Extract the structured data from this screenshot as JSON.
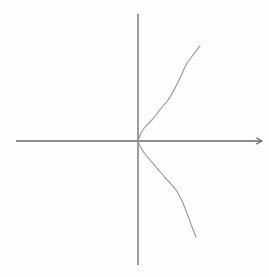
{
  "figure": {
    "title": "",
    "background_color": "#fefefe",
    "width": 269,
    "height": 277
  },
  "chart_data": {
    "type": "line",
    "title": "",
    "xlabel": "",
    "ylabel": "",
    "grid": false,
    "legend": null,
    "equation": "x = a*y^2",
    "origin_px": [
      138,
      141
    ],
    "xlim": [
      -122,
      124
    ],
    "ylim": [
      -124,
      127
    ],
    "axes": {
      "x_axis": {
        "name": "x-axis",
        "y_px": 141,
        "x_start_px": 16,
        "x_end_px": 262,
        "arrow": "right",
        "color": "#666666",
        "tick_labels": []
      },
      "y_axis": {
        "name": "y-axis",
        "x_px": 138,
        "y_start_px": 14,
        "y_end_px": 265,
        "arrow": "none",
        "color": "#666666",
        "tick_labels": []
      }
    },
    "series": [
      {
        "name": "parabola-upper-branch",
        "color": "#9a9a9a",
        "points_px": [
          [
            138,
            141
          ],
          [
            141,
            133
          ],
          [
            145,
            127
          ],
          [
            150,
            122
          ],
          [
            156,
            115
          ],
          [
            163,
            106
          ],
          [
            168,
            100
          ],
          [
            174,
            90
          ],
          [
            180,
            78
          ],
          [
            186,
            65
          ],
          [
            193,
            55
          ],
          [
            200,
            46
          ]
        ]
      },
      {
        "name": "parabola-lower-branch",
        "color": "#9a9a9a",
        "points_px": [
          [
            138,
            141
          ],
          [
            141,
            148
          ],
          [
            145,
            154
          ],
          [
            150,
            160
          ],
          [
            156,
            167
          ],
          [
            162,
            174
          ],
          [
            169,
            182
          ],
          [
            176,
            190
          ],
          [
            182,
            201
          ],
          [
            188,
            216
          ],
          [
            192,
            227
          ],
          [
            196,
            237
          ]
        ]
      }
    ]
  }
}
